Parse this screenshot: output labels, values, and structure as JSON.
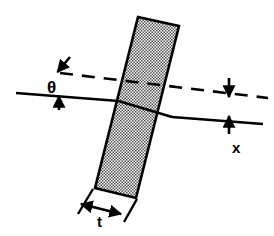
{
  "figure": {
    "kind": "optical-ray-diagram",
    "background_color": "#ffffff",
    "line_color": "#000000",
    "plate_fill_color": "#b4b4b4",
    "plate_edge_color": "#000000",
    "labels": {
      "angle": "θ",
      "displacement": "x",
      "thickness": "t"
    },
    "elements": {
      "plate_name": "tilted-glass-plate",
      "incident_ray_name": "incident-ray",
      "refracted_ray_name": "refracted-ray-inside-plate",
      "exit_ray_name": "exit-ray",
      "undeviated_ray_name": "undeviated-dashed-ray",
      "angle_arrows_name": "angle-indicator-arrows",
      "displacement_arrows_name": "displacement-indicator-arrows",
      "thickness_arrow_name": "thickness-dimension-arrow"
    },
    "geometry": {
      "plate_corners": [
        [
          138,
          17
        ],
        [
          179,
          26
        ],
        [
          136,
          198
        ],
        [
          95,
          188
        ]
      ],
      "incident_ray": [
        [
          18,
          94
        ],
        [
          118,
          101
        ]
      ],
      "inside_ray": [
        [
          118,
          101
        ],
        [
          172,
          117
        ]
      ],
      "exit_ray": [
        [
          172,
          117
        ],
        [
          262,
          124
        ]
      ],
      "dashed_ray": [
        [
          60,
          73
        ],
        [
          268,
          98
        ]
      ],
      "angle_vertex": [
        118,
        101
      ],
      "displacement_x_top": 98,
      "displacement_x_bottom": 115,
      "displacement_x_axis": 229,
      "thickness_dim_y": 208
    }
  }
}
